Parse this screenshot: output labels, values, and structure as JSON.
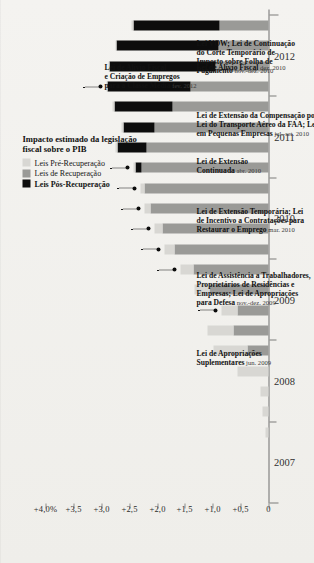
{
  "chart_data": {
    "type": "bar",
    "orientation": "horizontal-stacked",
    "xlabel": "",
    "ylabel": "",
    "value_axis_labels": [
      "+4,0%",
      "+3,5",
      "+3,0",
      "+2,5",
      "+2,0",
      "+1,5",
      "+1,0",
      "+0,5",
      "0"
    ],
    "value_axis_values": [
      4.0,
      3.5,
      3.0,
      2.5,
      2.0,
      1.5,
      1.0,
      0.5,
      0
    ],
    "xlim": [
      0,
      4.0
    ],
    "grid": false,
    "legend_position": "bottom-left",
    "year_labels": [
      "2007",
      "2008",
      "2009",
      "2010",
      "2011",
      "2012"
    ],
    "series": [
      {
        "name": "Leis Pré-Recuperação",
        "color": "#d8d7d3"
      },
      {
        "name": "Leis de Recuperação",
        "color": "#9a9a97"
      },
      {
        "name": "Leis Pós-Recuperação",
        "color": "#0d0d0d"
      }
    ],
    "categories": [
      "2007 Q1",
      "2007 Q2",
      "2007 Q3",
      "2007 Q4",
      "2008 Q1",
      "2008 Q2",
      "2008 Q3",
      "2008 Q4",
      "2009 Q1",
      "2009 Q2",
      "2009 Q3",
      "2009 Q4",
      "2010 Q1",
      "2010 Q2",
      "2010 Q3",
      "2010 Q4",
      "2011 Q1",
      "2011 Q2",
      "2011 Q3",
      "2011 Q4",
      "2012 Q1",
      "2012 Q2",
      "2012 Q3",
      "2012 Q4"
    ],
    "bars": [
      {
        "category": "2007 Q1",
        "pre": 0.0,
        "rec": 0.0,
        "post": 0.0
      },
      {
        "category": "2007 Q2",
        "pre": 0.0,
        "rec": 0.0,
        "post": 0.0
      },
      {
        "category": "2007 Q3",
        "pre": 0.0,
        "rec": 0.0,
        "post": 0.0
      },
      {
        "category": "2007 Q4",
        "pre": 0.05,
        "rec": 0.0,
        "post": 0.0
      },
      {
        "category": "2008 Q1",
        "pre": 0.1,
        "rec": 0.0,
        "post": 0.0
      },
      {
        "category": "2008 Q2",
        "pre": 0.15,
        "rec": 0.0,
        "post": 0.0
      },
      {
        "category": "2008 Q3",
        "pre": 0.55,
        "rec": 0.0,
        "post": 0.0
      },
      {
        "category": "2008 Q4",
        "pre": 0.6,
        "rec": 0.38,
        "post": 0.0
      },
      {
        "category": "2009 Q1",
        "pre": 0.48,
        "rec": 0.62,
        "post": 0.0
      },
      {
        "category": "2009 Q2",
        "pre": 0.3,
        "rec": 0.55,
        "post": 0.0
      },
      {
        "category": "2009 Q3",
        "pre": 0.28,
        "rec": 1.05,
        "post": 0.0
      },
      {
        "category": "2009 Q4",
        "pre": 0.22,
        "rec": 1.35,
        "post": 0.0
      },
      {
        "category": "2010 Q1",
        "pre": 0.18,
        "rec": 1.68,
        "post": 0.0
      },
      {
        "category": "2010 Q2",
        "pre": 0.14,
        "rec": 1.9,
        "post": 0.0
      },
      {
        "category": "2010 Q3",
        "pre": 0.1,
        "rec": 2.12,
        "post": 0.0
      },
      {
        "category": "2010 Q4",
        "pre": 0.07,
        "rec": 2.22,
        "post": 0.0
      },
      {
        "category": "2011 Q1",
        "pre": 0.05,
        "rec": 2.28,
        "post": 0.1
      },
      {
        "category": "2011 Q2",
        "pre": 0.04,
        "rec": 2.18,
        "post": 0.52
      },
      {
        "category": "2011 Q3",
        "pre": 0.03,
        "rec": 2.05,
        "post": 0.55
      },
      {
        "category": "2011 Q4",
        "pre": 0.02,
        "rec": 1.72,
        "post": 1.05
      },
      {
        "category": "2012 Q1",
        "pre": 0.02,
        "rec": 1.4,
        "post": 1.48
      },
      {
        "category": "2012 Q2",
        "pre": 0.02,
        "rec": 0.95,
        "post": 1.9
      },
      {
        "category": "2012 Q3",
        "pre": 0.02,
        "rec": 0.9,
        "post": 1.82
      },
      {
        "category": "2012 Q4",
        "pre": 0.02,
        "rec": 0.88,
        "post": 1.55
      }
    ],
    "annotations": [
      {
        "id": "apropriacoes-suplementares",
        "title": "Lei de Apropriações\nSuplementares",
        "date": "jun. 2009",
        "target_category": "2009 Q2"
      },
      {
        "id": "assistencia-trabalhadores",
        "title": "Lei de Assistência a Trabalhadores,\nProprietários de Residências e\nEmpresas; Lei de Apropriações\npara Defesa",
        "date": "nov.-dez. 2009",
        "target_category": "2009 Q4"
      },
      {
        "id": "extensao-temporaria",
        "title": "Lei de Extensão Temporária; Lei\nde Incentivo a Contratações para\nRestaurar o Emprego",
        "date": "mar. 2010",
        "target_category": "2010 Q1"
      },
      {
        "id": "extensao-continuada",
        "title": "Lei de Extensão\nContinuada",
        "date": "abr. 2010",
        "target_category": "2010 Q2"
      },
      {
        "id": "compensacao-desemprego",
        "title": "Lei de Extensão da Compensação por Desemprego;\nLei do Transporte Aéreo da FAA; Lei do Emprego\nem Pequenas Empresas",
        "date": "jul.-set. 2010",
        "target_category": "2010 Q3"
      },
      {
        "id": "alivio-fiscal-dez2010",
        "title": "Lei de Alívio Fiscal",
        "date": "dez. 2010",
        "target_category": "2010 Q4"
      },
      {
        "id": "lei-vow",
        "title": "Lei VOW; Lei de Continuação\ndo Corte Temporário de\nImposto sobre Folha de\nPagamento",
        "date": "nov.-dez. 2010",
        "target_category": "2011 Q1"
      },
      {
        "id": "alivio-fiscal-classe-media",
        "title": "Lei de Alívio Fiscal\ne Criação de Empregos\npara a Classe Média",
        "date": "fev. 2012",
        "target_category": "2012 Q1"
      }
    ]
  },
  "legend": {
    "title_line1": "Impacto estimado da legislação",
    "title_line2": "fiscal sobre o PIB",
    "items": [
      {
        "label": "Leis Pré-Recuperação",
        "color": "#d8d7d3",
        "bold": false
      },
      {
        "label": "Leis de Recuperação",
        "color": "#9a9a97",
        "bold": false
      },
      {
        "label": "Leis Pós-Recuperação",
        "color": "#0d0d0d",
        "bold": true
      }
    ]
  }
}
